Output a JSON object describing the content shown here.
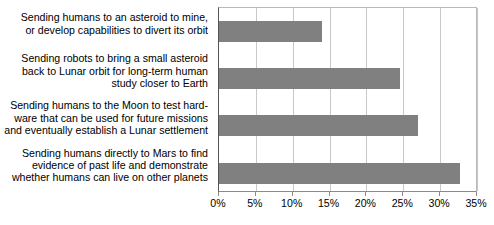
{
  "chart_data": {
    "type": "bar",
    "orientation": "horizontal",
    "title": "",
    "xlabel": "",
    "ylabel": "",
    "xlim": [
      0,
      35
    ],
    "xticks": [
      "0%",
      "5%",
      "10%",
      "15%",
      "20%",
      "25%",
      "30%",
      "35%"
    ],
    "xtick_values": [
      0,
      5,
      10,
      15,
      20,
      25,
      30,
      35
    ],
    "grid": true,
    "legend": "none",
    "bar_color": "#808080",
    "categories": [
      "Sending humans to an asteroid to mine,\nor develop capabilities to divert its orbit",
      "Sending robots to bring a small asteroid\nback to Lunar orbit for long-term human\nstudy closer to Earth",
      "Sending humans to the Moon to test hard-\nware that can be used for future missions\nand eventually establish a Lunar settlement",
      "Sending humans directly to Mars to find\nevidence of past life and demonstrate\nwhether humans can live on other planets"
    ],
    "values": [
      14,
      24.5,
      27,
      32.7
    ]
  }
}
